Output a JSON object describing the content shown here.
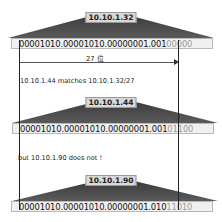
{
  "diagram": {
    "prefix_length_label": "27 位",
    "blocks": [
      {
        "ip": "10.10.1.32",
        "binary_network": "00001010.00001010.00000001.001",
        "binary_host": "00000"
      },
      {
        "ip": "10.10.1.44",
        "binary_network": "00001010.00001010.00000001.001",
        "binary_host": "01100"
      },
      {
        "ip": "10.10.1.90",
        "binary_network": "00001010.00001010.00000001.010",
        "binary_host": "11010"
      }
    ],
    "captions": [
      "10.10.1.44 matches 10.10.1.32/27",
      "but 10.10.1.90 does not !"
    ],
    "colors": {
      "triangle": "#4a4a4a",
      "host_bits": "#9a9a9a",
      "network_bits": "#111111",
      "label_bg": "#d8d8d8"
    }
  }
}
